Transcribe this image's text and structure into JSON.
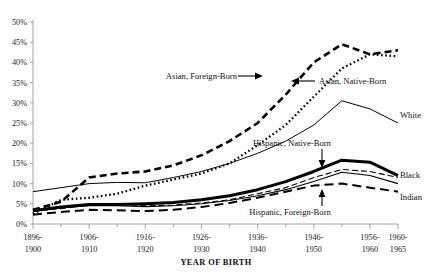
{
  "chart_data": {
    "type": "line",
    "title": "",
    "xlabel": "YEAR OF BIRTH",
    "ylabel": "",
    "ylim": [
      0,
      50
    ],
    "yticks": [
      0,
      5,
      10,
      15,
      20,
      25,
      30,
      35,
      40,
      45,
      50
    ],
    "ytick_labels": [
      "0%",
      "5%",
      "10%",
      "15%",
      "20%",
      "25%",
      "30%",
      "35%",
      "40%",
      "45%",
      "50%"
    ],
    "grid": false,
    "legend_position": "inline-annotations",
    "categories": [
      "1896-1900",
      "1901-1905",
      "1906-1910",
      "1911-1915",
      "1916-1920",
      "1921-1925",
      "1926-1930",
      "1931-1935",
      "1936-1940",
      "1941-1945",
      "1946-1950",
      "1951-1955",
      "1956-1960",
      "1960-1965"
    ],
    "xtick_labels": [
      {
        "line1": "1896-",
        "line2": "1900"
      },
      {
        "line1": "1906-",
        "line2": "1910"
      },
      {
        "line1": "1916-",
        "line2": "1920"
      },
      {
        "line1": "1926-",
        "line2": "1930"
      },
      {
        "line1": "1936-",
        "line2": "1940"
      },
      {
        "line1": "1946-",
        "line2": "1950"
      },
      {
        "line1": "1956-",
        "line2": "1960"
      },
      {
        "line1": "1960-",
        "line2": "1965"
      }
    ],
    "series": [
      {
        "name": "Asian, Foreign-Born",
        "style": "long-dash-thick",
        "values": [
          3.5,
          5.5,
          11.5,
          12.5,
          13.0,
          14.5,
          17.0,
          20.5,
          25.0,
          32.0,
          40.0,
          44.5,
          42.0,
          43.0
        ]
      },
      {
        "name": "Asian, Native-Born",
        "style": "dotted-thick",
        "values": [
          2.5,
          6.0,
          6.5,
          7.5,
          9.5,
          11.0,
          12.5,
          15.0,
          19.5,
          24.5,
          31.5,
          38.5,
          42.0,
          41.5
        ]
      },
      {
        "name": "White",
        "style": "thin-solid",
        "values": [
          8.0,
          9.0,
          10.0,
          10.3,
          10.2,
          11.5,
          13.0,
          15.0,
          17.5,
          20.5,
          24.5,
          30.5,
          28.5,
          25.0
        ]
      },
      {
        "name": "Hispanic, Native-Born",
        "style": "thin-dash",
        "values": [
          3.2,
          3.8,
          4.8,
          5.0,
          4.5,
          4.7,
          5.2,
          6.0,
          7.5,
          9.0,
          11.5,
          13.5,
          13.0,
          11.5
        ]
      },
      {
        "name": "Hispanic, Foreign-Born",
        "style": "medium-dash",
        "values": [
          2.3,
          3.0,
          3.5,
          3.4,
          3.2,
          3.5,
          4.2,
          5.2,
          6.5,
          8.0,
          9.5,
          10.0,
          9.0,
          8.0
        ]
      },
      {
        "name": "Black",
        "style": "thick-solid",
        "values": [
          3.3,
          4.2,
          4.8,
          4.8,
          5.0,
          5.3,
          6.0,
          7.0,
          8.5,
          10.5,
          13.0,
          15.8,
          15.3,
          12.0
        ]
      },
      {
        "name": "Indian",
        "style": "thin-solid-lower",
        "values": [
          3.3,
          4.0,
          4.5,
          4.5,
          4.3,
          4.5,
          5.0,
          5.8,
          7.0,
          8.5,
          10.5,
          12.8,
          12.0,
          10.0
        ]
      }
    ],
    "annotations": [
      {
        "text": "Asian, Foreign-Born",
        "anchor": "end"
      },
      {
        "text": "Asian, Native-Born",
        "anchor": "start"
      },
      {
        "text": "White",
        "anchor": "start"
      },
      {
        "text": "Hispanic, Native-Born",
        "anchor": "middle"
      },
      {
        "text": "Hispanic, Foreign-Born",
        "anchor": "middle"
      },
      {
        "text": "Black",
        "anchor": "start"
      },
      {
        "text": "Indian",
        "anchor": "start"
      }
    ]
  }
}
